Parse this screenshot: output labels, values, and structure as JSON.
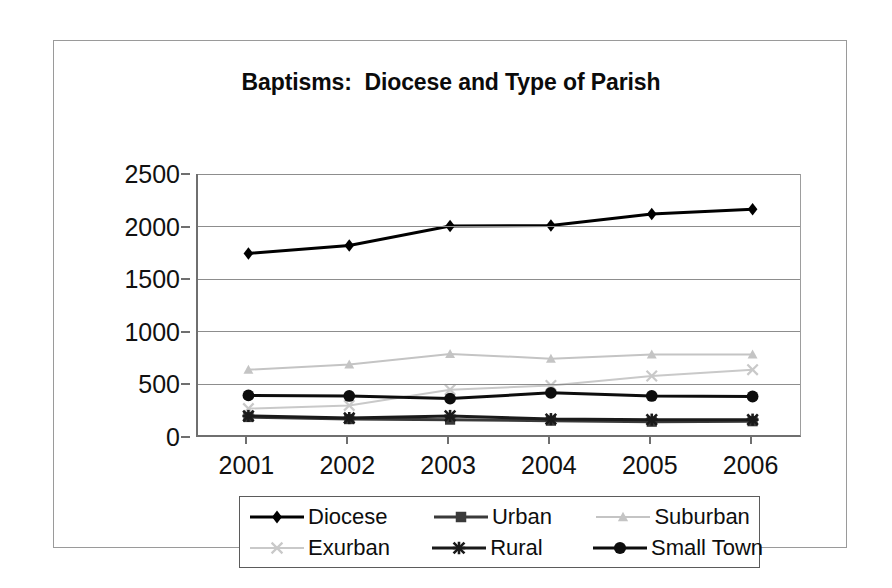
{
  "chart_data": {
    "type": "line",
    "title": "Baptisms:  Diocese and Type of Parish",
    "xlabel": "",
    "ylabel": "",
    "categories": [
      "2001",
      "2002",
      "2003",
      "2004",
      "2005",
      "2006"
    ],
    "x": [
      2001,
      2002,
      2003,
      2004,
      2005,
      2006
    ],
    "ylim": [
      0,
      2500
    ],
    "yticks": [
      0,
      500,
      1000,
      1500,
      2000,
      2500
    ],
    "ytick_labels": [
      "0",
      "500",
      "1000",
      "1500",
      "2000",
      "2500"
    ],
    "grid": true,
    "legend_position": "bottom",
    "series": [
      {
        "name": "Diocese",
        "marker": "diamond",
        "color": "#000000",
        "values": [
          1745,
          1820,
          2005,
          2010,
          2120,
          2165
        ]
      },
      {
        "name": "Urban",
        "marker": "square",
        "color": "#3a3a3a",
        "values": [
          190,
          170,
          165,
          155,
          145,
          150
        ]
      },
      {
        "name": "Suburban",
        "marker": "triangle",
        "color": "#c4c4c4",
        "values": [
          640,
          690,
          790,
          745,
          785,
          785
        ]
      },
      {
        "name": "Exurban",
        "marker": "x",
        "color": "#c9c9c9",
        "values": [
          270,
          300,
          450,
          490,
          580,
          640
        ]
      },
      {
        "name": "Rural",
        "marker": "star",
        "color": "#1a1a1a",
        "values": [
          200,
          180,
          200,
          170,
          165,
          165
        ]
      },
      {
        "name": "Small Town",
        "marker": "circle",
        "color": "#0d0d0d",
        "values": [
          395,
          390,
          365,
          420,
          390,
          385
        ]
      }
    ]
  },
  "chart": {
    "title": "Baptisms:  Diocese and Type of Parish",
    "y_ticks": [
      "2500",
      "2000",
      "1500",
      "1000",
      "500",
      "0"
    ],
    "x_ticks": [
      "2001",
      "2002",
      "2003",
      "2004",
      "2005",
      "2006"
    ]
  },
  "legend": {
    "items": [
      {
        "label": "Diocese",
        "marker": "diamond-marker-icon",
        "color": "#000000"
      },
      {
        "label": "Urban",
        "marker": "square-marker-icon",
        "color": "#3a3a3a"
      },
      {
        "label": "Suburban",
        "marker": "triangle-marker-icon",
        "color": "#c4c4c4"
      },
      {
        "label": "Exurban",
        "marker": "x-marker-icon",
        "color": "#c9c9c9"
      },
      {
        "label": "Rural",
        "marker": "star-marker-icon",
        "color": "#1a1a1a"
      },
      {
        "label": "Small Town",
        "marker": "circle-marker-icon",
        "color": "#0d0d0d"
      }
    ]
  },
  "colors": {
    "axis": "#6f6f6f",
    "gridline": "#8d8d8d",
    "frame": "#9a9a9a",
    "text": "#111111",
    "dark_series": "#000000",
    "light_series": "#c6c6c6"
  }
}
